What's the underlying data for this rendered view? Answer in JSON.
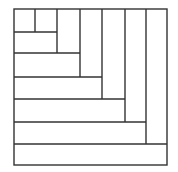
{
  "diagram": {
    "type": "nested-rectangle-spiral",
    "stroke_color": "#333333",
    "background": "#ffffff",
    "outer_box": {
      "x": 14,
      "y": 9,
      "width": 153,
      "height": 156
    },
    "segments": [
      {
        "orientation": "vertical",
        "x": 35,
        "y1": 9,
        "y2": 32
      },
      {
        "orientation": "horizontal",
        "y": 32,
        "x1": 14,
        "x2": 57
      },
      {
        "orientation": "vertical",
        "x": 57,
        "y1": 9,
        "y2": 53
      },
      {
        "orientation": "horizontal",
        "y": 53,
        "x1": 14,
        "x2": 80
      },
      {
        "orientation": "vertical",
        "x": 80,
        "y1": 9,
        "y2": 77
      },
      {
        "orientation": "horizontal",
        "y": 77,
        "x1": 14,
        "x2": 102
      },
      {
        "orientation": "vertical",
        "x": 102,
        "y1": 9,
        "y2": 99
      },
      {
        "orientation": "horizontal",
        "y": 99,
        "x1": 14,
        "x2": 125
      },
      {
        "orientation": "vertical",
        "x": 125,
        "y1": 9,
        "y2": 122
      },
      {
        "orientation": "horizontal",
        "y": 122,
        "x1": 14,
        "x2": 146
      },
      {
        "orientation": "vertical",
        "x": 146,
        "y1": 9,
        "y2": 144
      },
      {
        "orientation": "horizontal",
        "y": 144,
        "x1": 14,
        "x2": 167
      }
    ]
  }
}
